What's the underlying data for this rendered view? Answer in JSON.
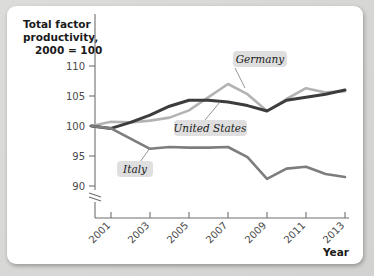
{
  "chart_data": {
    "type": "line",
    "title": "",
    "ylabel": "Total factor productivity, 2000 = 100",
    "xlabel": "Year",
    "ylim": [
      88,
      112
    ],
    "yticks": [
      90,
      95,
      100,
      105,
      110
    ],
    "ytick_labels": [
      "90",
      "95",
      "100",
      "105",
      "110"
    ],
    "axis_break": true,
    "xlim": [
      2000,
      2013
    ],
    "xticks": [
      2001,
      2003,
      2005,
      2007,
      2009,
      2011,
      2013
    ],
    "xtick_labels": [
      "2001",
      "2003",
      "2005",
      "2007",
      "2009",
      "2011",
      "2013"
    ],
    "grid": false,
    "legend_position": "inline-annotations",
    "x": [
      2000,
      2001,
      2002,
      2003,
      2004,
      2005,
      2006,
      2007,
      2008,
      2009,
      2010,
      2011,
      2012,
      2013
    ],
    "series": [
      {
        "name": "Germany",
        "color": "#b3b3b3",
        "values": [
          100,
          100.7,
          100.6,
          100.9,
          101.4,
          102.6,
          104.8,
          107.0,
          105.3,
          102.5,
          104.5,
          106.3,
          105.6,
          105.8
        ]
      },
      {
        "name": "United States",
        "color": "#3c3c3c",
        "values": [
          100,
          99.6,
          100.6,
          101.8,
          103.3,
          104.3,
          104.3,
          104.0,
          103.4,
          102.5,
          104.3,
          104.8,
          105.3,
          106.0
        ]
      },
      {
        "name": "Italy",
        "color": "#7d7d7d",
        "values": [
          100,
          99.6,
          97.9,
          96.2,
          96.5,
          96.4,
          96.4,
          96.5,
          94.8,
          91.2,
          92.9,
          93.2,
          92.0,
          91.5
        ]
      }
    ],
    "annotations": [
      {
        "text": "Germany",
        "series": "Germany"
      },
      {
        "text": "United States",
        "series": "United States"
      },
      {
        "text": "Italy",
        "series": "Italy"
      }
    ]
  }
}
